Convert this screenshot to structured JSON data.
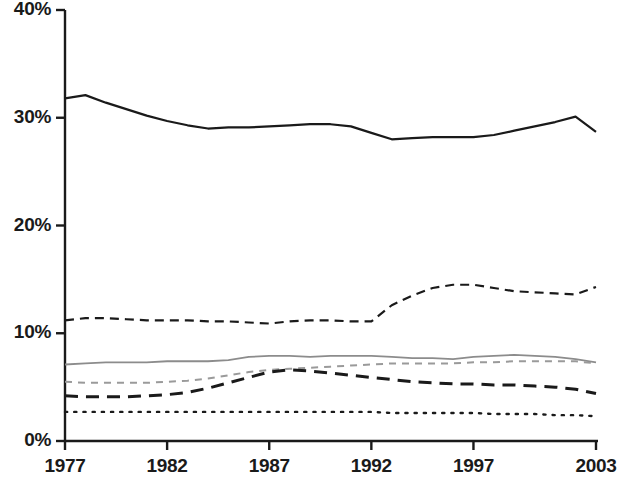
{
  "chart_data": {
    "type": "line",
    "title": "",
    "subtitle": "",
    "xlabel": "",
    "ylabel": "",
    "xlim": [
      1977,
      2003
    ],
    "ylim": [
      0,
      40
    ],
    "grid": false,
    "legend": "none",
    "y_ticks": [
      "0%",
      "10%",
      "20%",
      "30%",
      "40%"
    ],
    "y_tick_values": [
      0,
      10,
      20,
      30,
      40
    ],
    "x_ticks": [
      "1977",
      "1982",
      "1987",
      "1992",
      "1997",
      "2003"
    ],
    "x_tick_values": [
      1977,
      1982,
      1987,
      1992,
      1997,
      2003
    ],
    "x": [
      1977,
      1978,
      1979,
      1980,
      1981,
      1982,
      1983,
      1984,
      1985,
      1986,
      1987,
      1988,
      1989,
      1990,
      1991,
      1992,
      1993,
      1994,
      1995,
      1996,
      1997,
      1998,
      1999,
      2000,
      2001,
      2002,
      2003
    ],
    "series": [
      {
        "name": "series-1-solid-black",
        "style": "solid",
        "color": "#1a1a1a",
        "width": 2.2,
        "values": [
          31.8,
          32.1,
          31.4,
          30.8,
          30.2,
          29.7,
          29.3,
          29.0,
          29.1,
          29.1,
          29.2,
          29.3,
          29.4,
          29.4,
          29.2,
          28.6,
          28.0,
          28.1,
          28.2,
          28.2,
          28.2,
          28.4,
          28.8,
          29.2,
          29.6,
          30.1,
          28.7
        ]
      },
      {
        "name": "series-2-dashed-black",
        "style": "dashed",
        "color": "#1a1a1a",
        "width": 2.2,
        "values": [
          11.2,
          11.4,
          11.4,
          11.3,
          11.2,
          11.2,
          11.2,
          11.1,
          11.1,
          11.0,
          10.9,
          11.1,
          11.2,
          11.2,
          11.1,
          11.1,
          12.6,
          13.5,
          14.2,
          14.5,
          14.5,
          14.2,
          13.9,
          13.8,
          13.7,
          13.6,
          14.3
        ]
      },
      {
        "name": "series-3-solid-gray",
        "style": "solid",
        "color": "#8c8c8c",
        "width": 1.8,
        "values": [
          7.1,
          7.2,
          7.3,
          7.3,
          7.3,
          7.4,
          7.4,
          7.4,
          7.5,
          7.8,
          7.9,
          7.9,
          7.8,
          7.9,
          7.9,
          7.9,
          7.8,
          7.7,
          7.7,
          7.6,
          7.8,
          7.9,
          8.0,
          7.9,
          7.8,
          7.6,
          7.3
        ]
      },
      {
        "name": "series-4-dotted-gray",
        "style": "dotted-dash",
        "color": "#9a9a9a",
        "width": 2.0,
        "values": [
          5.5,
          5.4,
          5.4,
          5.4,
          5.4,
          5.5,
          5.6,
          5.8,
          6.1,
          6.4,
          6.6,
          6.7,
          6.8,
          6.9,
          7.0,
          7.1,
          7.2,
          7.2,
          7.2,
          7.2,
          7.3,
          7.3,
          7.4,
          7.4,
          7.4,
          7.4,
          7.2
        ]
      },
      {
        "name": "series-5-longdash-black",
        "style": "long-dash",
        "color": "#1a1a1a",
        "width": 3.0,
        "values": [
          4.2,
          4.1,
          4.1,
          4.1,
          4.2,
          4.3,
          4.5,
          4.9,
          5.4,
          5.9,
          6.4,
          6.6,
          6.5,
          6.3,
          6.1,
          5.9,
          5.7,
          5.5,
          5.4,
          5.3,
          5.3,
          5.2,
          5.2,
          5.1,
          5.0,
          4.8,
          4.4
        ]
      },
      {
        "name": "series-6-dotted-black",
        "style": "dotted",
        "color": "#1a1a1a",
        "width": 2.4,
        "values": [
          2.7,
          2.7,
          2.7,
          2.7,
          2.7,
          2.7,
          2.7,
          2.7,
          2.7,
          2.7,
          2.7,
          2.7,
          2.7,
          2.7,
          2.7,
          2.7,
          2.6,
          2.6,
          2.6,
          2.6,
          2.6,
          2.5,
          2.5,
          2.5,
          2.4,
          2.4,
          2.3
        ]
      }
    ]
  },
  "axis": {
    "axis_color": "#1a1a1a",
    "y_axis_x": 65,
    "x_axis_y": 441,
    "plot_right": 596,
    "plot_top": 10
  }
}
